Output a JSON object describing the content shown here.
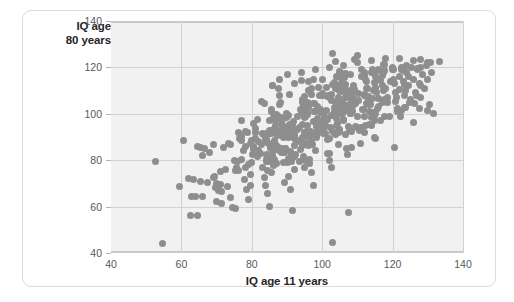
{
  "figure": {
    "y_axis_title_line1": "IQ age",
    "y_axis_title_line2": "80 years",
    "x_axis_title": "IQ age 11 years"
  },
  "chart_data": {
    "type": "scatter",
    "title": "",
    "xlabel": "IQ age 11 years",
    "ylabel": "IQ age 80 years",
    "xlim": [
      40,
      140
    ],
    "ylim": [
      40,
      140
    ],
    "xticks": [
      40,
      60,
      80,
      100,
      120,
      140
    ],
    "yticks": [
      40,
      60,
      80,
      100,
      120,
      140
    ],
    "grid": true,
    "legend": null,
    "marker_color": "#8e8e8e",
    "marker_size_px": 7,
    "plot_background": "#f1f1f1",
    "gridline_color": "#d2d2d2",
    "n_points": 340,
    "relationship": "strong positive correlation",
    "points": [
      [
        52.5,
        79.5
      ],
      [
        54.5,
        44.0
      ],
      [
        62.5,
        56.0
      ],
      [
        64.5,
        56.0
      ],
      [
        59.5,
        68.5
      ],
      [
        60.5,
        88.5
      ],
      [
        63.0,
        64.5
      ],
      [
        64.0,
        64.5
      ],
      [
        66.0,
        64.5
      ],
      [
        62.0,
        72.0
      ],
      [
        63.5,
        71.5
      ],
      [
        65.5,
        71.0
      ],
      [
        67.5,
        70.5
      ],
      [
        64.5,
        86.0
      ],
      [
        65.5,
        85.5
      ],
      [
        66.5,
        85.0
      ],
      [
        68.0,
        83.5
      ],
      [
        69.5,
        73.0
      ],
      [
        70.0,
        62.0
      ],
      [
        71.5,
        61.5
      ],
      [
        70.5,
        67.0
      ],
      [
        71.5,
        66.5
      ],
      [
        72.5,
        76.0
      ],
      [
        73.5,
        87.0
      ],
      [
        74.5,
        59.5
      ],
      [
        75.5,
        59.0
      ],
      [
        73.0,
        68.5
      ],
      [
        74.0,
        64.0
      ],
      [
        75.0,
        80.0
      ],
      [
        76.0,
        79.5
      ],
      [
        76.5,
        89.5
      ],
      [
        77.5,
        84.0
      ],
      [
        78.0,
        71.5
      ],
      [
        78.5,
        67.5
      ],
      [
        79.0,
        63.0
      ],
      [
        79.5,
        74.0
      ],
      [
        80.0,
        79.0
      ],
      [
        80.5,
        86.0
      ],
      [
        81.0,
        92.0
      ],
      [
        81.5,
        97.5
      ],
      [
        82.0,
        88.0
      ],
      [
        82.5,
        83.0
      ],
      [
        83.0,
        77.0
      ],
      [
        83.5,
        72.5
      ],
      [
        84.0,
        69.0
      ],
      [
        84.5,
        65.5
      ],
      [
        85.0,
        60.0
      ],
      [
        85.5,
        74.5
      ],
      [
        86.0,
        81.0
      ],
      [
        86.5,
        87.5
      ],
      [
        87.0,
        93.0
      ],
      [
        87.5,
        99.0
      ],
      [
        88.0,
        104.0
      ],
      [
        88.5,
        96.0
      ],
      [
        89.0,
        90.0
      ],
      [
        89.5,
        85.0
      ],
      [
        90.0,
        79.0
      ],
      [
        90.5,
        73.0
      ],
      [
        91.0,
        67.5
      ],
      [
        91.5,
        58.5
      ],
      [
        92.0,
        76.0
      ],
      [
        92.5,
        82.5
      ],
      [
        93.0,
        88.0
      ],
      [
        93.5,
        94.0
      ],
      [
        94.0,
        100.0
      ],
      [
        94.5,
        106.0
      ],
      [
        95.0,
        98.5
      ],
      [
        95.5,
        92.5
      ],
      [
        96.0,
        86.5
      ],
      [
        96.5,
        80.5
      ],
      [
        97.0,
        74.5
      ],
      [
        97.5,
        69.0
      ],
      [
        98.0,
        84.0
      ],
      [
        98.5,
        90.0
      ],
      [
        99.0,
        96.0
      ],
      [
        99.5,
        102.0
      ],
      [
        100.0,
        108.0
      ],
      [
        100.5,
        101.0
      ],
      [
        101.0,
        95.0
      ],
      [
        101.5,
        89.0
      ],
      [
        102.0,
        83.0
      ],
      [
        102.5,
        77.0
      ],
      [
        103.0,
        44.5
      ],
      [
        103.5,
        92.0
      ],
      [
        104.0,
        98.0
      ],
      [
        104.5,
        104.0
      ],
      [
        105.0,
        110.0
      ],
      [
        105.5,
        103.0
      ],
      [
        106.0,
        97.0
      ],
      [
        106.5,
        91.0
      ],
      [
        107.0,
        85.0
      ],
      [
        107.5,
        57.5
      ],
      [
        108.0,
        100.0
      ],
      [
        108.5,
        106.0
      ],
      [
        109.0,
        112.0
      ],
      [
        109.5,
        105.0
      ],
      [
        110.0,
        99.0
      ],
      [
        110.5,
        93.0
      ],
      [
        111.0,
        87.0
      ],
      [
        111.5,
        102.0
      ],
      [
        112.0,
        108.0
      ],
      [
        112.5,
        114.0
      ],
      [
        113.0,
        107.0
      ],
      [
        113.5,
        101.0
      ],
      [
        114.0,
        95.0
      ],
      [
        114.5,
        110.0
      ],
      [
        115.0,
        116.0
      ],
      [
        115.5,
        109.0
      ],
      [
        116.0,
        103.0
      ],
      [
        116.5,
        97.0
      ],
      [
        117.0,
        112.0
      ],
      [
        117.5,
        118.0
      ],
      [
        118.0,
        111.0
      ],
      [
        118.5,
        105.0
      ],
      [
        119.0,
        99.0
      ],
      [
        119.5,
        114.0
      ],
      [
        120.0,
        119.0
      ],
      [
        120.5,
        113.0
      ],
      [
        121.0,
        107.0
      ],
      [
        121.5,
        101.0
      ],
      [
        122.0,
        116.0
      ],
      [
        122.5,
        120.0
      ],
      [
        123.0,
        114.0
      ],
      [
        123.5,
        108.0
      ],
      [
        124.0,
        118.0
      ],
      [
        124.5,
        112.0
      ],
      [
        125.0,
        106.0
      ],
      [
        125.5,
        120.0
      ],
      [
        126.0,
        115.0
      ],
      [
        126.5,
        109.0
      ],
      [
        127.0,
        119.0
      ],
      [
        127.5,
        113.0
      ],
      [
        128.0,
        107.0
      ],
      [
        128.5,
        117.0
      ],
      [
        129.0,
        111.0
      ],
      [
        129.5,
        121.0
      ],
      [
        130.0,
        115.0
      ],
      [
        130.5,
        104.0
      ],
      [
        131.0,
        118.0
      ],
      [
        131.5,
        100.0
      ],
      [
        86.0,
        112.0
      ],
      [
        88.0,
        115.0
      ],
      [
        90.0,
        117.0
      ],
      [
        92.0,
        113.0
      ],
      [
        94.0,
        118.0
      ],
      [
        96.0,
        114.0
      ],
      [
        98.0,
        119.0
      ],
      [
        100.0,
        115.0
      ],
      [
        102.0,
        120.0
      ],
      [
        104.0,
        116.0
      ],
      [
        106.0,
        121.0
      ],
      [
        108.0,
        117.0
      ],
      [
        110.0,
        122.0
      ],
      [
        112.0,
        118.0
      ],
      [
        114.0,
        123.0
      ],
      [
        116.0,
        119.0
      ],
      [
        118.0,
        124.0
      ],
      [
        120.0,
        120.0
      ],
      [
        122.0,
        124.0
      ],
      [
        124.0,
        121.0
      ],
      [
        126.0,
        123.0
      ],
      [
        128.0,
        120.0
      ],
      [
        130.0,
        122.0
      ],
      [
        103.0,
        126.0
      ],
      [
        110.0,
        125.0
      ]
    ]
  }
}
